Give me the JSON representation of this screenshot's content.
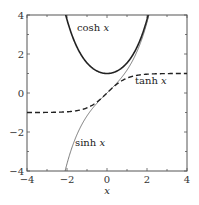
{
  "chart_data": {
    "type": "line",
    "title": "",
    "xlabel": "x",
    "ylabel": "",
    "xlim": [
      -4,
      4
    ],
    "ylim": [
      -4,
      4
    ],
    "grid": false,
    "xticks": [
      "−4",
      "−2",
      "0",
      "2",
      "4"
    ],
    "yticks": [
      "4",
      "2",
      "0",
      "−2",
      "−4"
    ],
    "series": [
      {
        "name": "cosh x",
        "style": "thick solid",
        "function": "cosh",
        "x": [
          -2.06,
          -1.5,
          -1,
          -0.5,
          0,
          0.5,
          1,
          1.5,
          2.06
        ],
        "values": [
          4.0,
          2.35,
          1.54,
          1.13,
          1.0,
          1.13,
          1.54,
          2.35,
          4.0
        ]
      },
      {
        "name": "sinh x",
        "style": "thin solid",
        "function": "sinh",
        "x": [
          -2.1,
          -1.5,
          -1,
          -0.5,
          0,
          0.5,
          1,
          1.5,
          2.1
        ],
        "values": [
          -4.0,
          -2.13,
          -1.18,
          -0.52,
          0,
          0.52,
          1.18,
          2.13,
          4.0
        ]
      },
      {
        "name": "tanh x",
        "style": "dashed",
        "function": "tanh",
        "x": [
          -4,
          -3,
          -2,
          -1,
          0,
          1,
          2,
          3,
          4
        ],
        "values": [
          -1.0,
          -0.995,
          -0.96,
          -0.76,
          0,
          0.76,
          0.96,
          0.995,
          1.0
        ]
      }
    ],
    "annotations": [
      {
        "text_fn": "cosh",
        "text_var": "x",
        "x": -1.5,
        "y": 3.2
      },
      {
        "text_fn": "tanh",
        "text_var": "x",
        "x": 1.4,
        "y": 0.45
      },
      {
        "text_fn": "sinh",
        "text_var": "x",
        "x": -1.6,
        "y": -2.7
      }
    ]
  }
}
